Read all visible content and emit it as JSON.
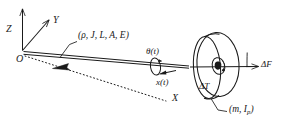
{
  "figure": {
    "type": "engineering-schematic"
  },
  "axes": {
    "origin_label": "O",
    "z_label": "Z",
    "y_label": "Y",
    "x_label": "X"
  },
  "shaft": {
    "parameters_label": "(ρ, J, L, A, E)"
  },
  "disk": {
    "properties_label": "(m, I",
    "properties_sub": "p",
    "properties_close": ")",
    "torque_label": "ΔT",
    "force_label": "ΔF"
  },
  "motion": {
    "theta_label": "θ(t)",
    "x_label": "x(t)"
  },
  "colors": {
    "stroke": "#1a1a1a",
    "background": "#ffffff"
  }
}
